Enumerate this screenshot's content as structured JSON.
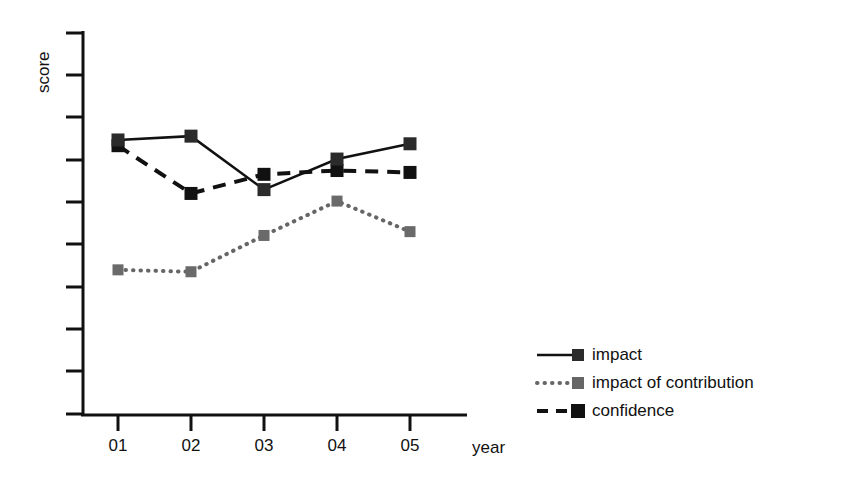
{
  "chart_data": {
    "type": "line",
    "title": "",
    "xlabel": "year",
    "ylabel": "score",
    "categories": [
      "01",
      "02",
      "03",
      "04",
      "05"
    ],
    "grid": false,
    "legend_position": "bottom-right",
    "ylim": [
      0,
      10
    ],
    "yticks": [
      1,
      2,
      3,
      4,
      5,
      6,
      7,
      8,
      9,
      10
    ],
    "ytick_labels": [
      "",
      "",
      "",
      "",
      "",
      "",
      "",
      "",
      "",
      ""
    ],
    "series": [
      {
        "name": "impact",
        "line_style": "solid",
        "color": "#111111",
        "marker": "square",
        "values": [
          7.2,
          7.3,
          5.9,
          6.7,
          7.1
        ]
      },
      {
        "name": "impact of contribution",
        "line_style": "dotted",
        "color": "#666666",
        "marker": "square",
        "values": [
          3.8,
          3.75,
          4.7,
          5.6,
          4.8
        ]
      },
      {
        "name": "confidence",
        "line_style": "dashed",
        "color": "#111111",
        "marker": "square",
        "values": [
          7.05,
          5.8,
          6.3,
          6.4,
          6.35
        ]
      }
    ]
  },
  "axes": {
    "y_label": "score",
    "x_label": "year",
    "x_tick_labels": [
      "01",
      "02",
      "03",
      "04",
      "05"
    ]
  },
  "legend": {
    "entries": [
      {
        "label": "impact",
        "style": "solid",
        "color": "#111111"
      },
      {
        "label": "impact of contribution",
        "style": "dotted",
        "color": "#666666"
      },
      {
        "label": "confidence",
        "style": "dashed",
        "color": "#111111"
      }
    ]
  },
  "colors": {
    "background": "#ffffff",
    "axis": "#111111",
    "series_dark": "#111111",
    "series_gray": "#666666"
  }
}
